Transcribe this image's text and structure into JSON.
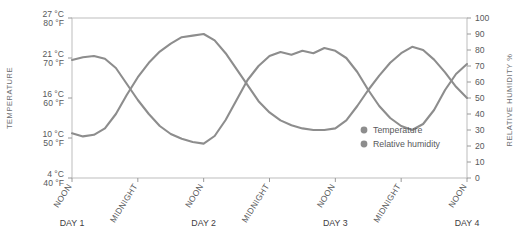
{
  "chart_data": {
    "type": "line",
    "title": "",
    "xlabel": "",
    "ylabel": "TEMPERATURE",
    "y2label": "RELATIVE HUMIDITY %",
    "grid": false,
    "legend_position": "inside-bottom-right",
    "x_tick_labels": [
      "NOON",
      "MIDNIGHT",
      "NOON",
      "MIDNIGHT",
      "NOON",
      "MIDNIGHT",
      "NOON"
    ],
    "x_day_labels": [
      "DAY 1",
      "",
      "DAY 2",
      "",
      "DAY 3",
      "",
      "DAY 4"
    ],
    "y_left_ticks": [
      {
        "c": "27 °C",
        "f": "80 °F",
        "value": 80
      },
      {
        "c": "21 °C",
        "f": "70 °F",
        "value": 70
      },
      {
        "c": "16 °C",
        "f": "60 °F",
        "value": 60
      },
      {
        "c": "10 °C",
        "f": "50 °F",
        "value": 50
      },
      {
        "c": "4 °C",
        "f": "40 °F",
        "value": 40
      }
    ],
    "y_left_lim": [
      40,
      80
    ],
    "y_right_ticks": [
      100,
      90,
      80,
      70,
      60,
      50,
      40,
      30,
      20,
      10,
      0
    ],
    "y_right_lim": [
      0,
      100
    ],
    "x": [
      0,
      0.08,
      0.16,
      0.25,
      0.33,
      0.42,
      0.5,
      0.58,
      0.66,
      0.75,
      0.83,
      0.92,
      1,
      1.08,
      1.16,
      1.25,
      1.33,
      1.42,
      1.5,
      1.58,
      1.66,
      1.75,
      1.83,
      1.92,
      2,
      2.08,
      2.16,
      2.25,
      2.33,
      2.42,
      2.5,
      2.58,
      2.66,
      2.75,
      2.83,
      2.92,
      3
    ],
    "series": [
      {
        "name": "Temperature",
        "unit": "°F",
        "color": "#8d8d8d",
        "values": [
          69.5,
          70.2,
          70.5,
          69.8,
          67.5,
          63.5,
          59.5,
          56.0,
          53.0,
          51.0,
          49.8,
          49.0,
          48.6,
          50.5,
          54.5,
          59.5,
          64.5,
          68.0,
          70.5,
          71.5,
          70.8,
          71.8,
          71.2,
          72.5,
          71.8,
          70.0,
          66.5,
          62.0,
          58.0,
          55.0,
          53.0,
          52.0,
          53.5,
          57.0,
          62.0,
          66.0,
          68.5
        ]
      },
      {
        "name": "Relative humidity",
        "unit": "%",
        "color": "#8d8d8d",
        "values": [
          28,
          26,
          27,
          31,
          40,
          52,
          63,
          72,
          79,
          84,
          88,
          89,
          90,
          86,
          78,
          68,
          58,
          48,
          41,
          36,
          33,
          31,
          30,
          30,
          31,
          36,
          45,
          55,
          64,
          72,
          78,
          82,
          80,
          74,
          66,
          57,
          50
        ]
      }
    ],
    "legend": [
      {
        "label": "Temperature",
        "color": "#8d8d8d"
      },
      {
        "label": "Relative humidity",
        "color": "#8d8d8d"
      }
    ]
  }
}
